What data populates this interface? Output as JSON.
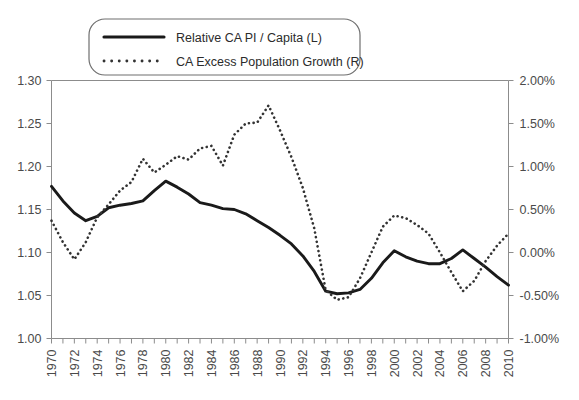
{
  "chart_data": {
    "type": "line",
    "title": "",
    "subtitle": "",
    "xlabel": "",
    "ylabel": "",
    "grid": false,
    "legend_position": "top-left",
    "x": [
      1970,
      1971,
      1972,
      1973,
      1974,
      1975,
      1976,
      1977,
      1978,
      1979,
      1980,
      1981,
      1982,
      1983,
      1984,
      1985,
      1986,
      1987,
      1988,
      1989,
      1990,
      1991,
      1992,
      1993,
      1994,
      1995,
      1996,
      1997,
      1998,
      1999,
      2000,
      2001,
      2002,
      2003,
      2004,
      2005,
      2006,
      2007,
      2008,
      2009,
      2010
    ],
    "xtick_labels": [
      "1970",
      "1972",
      "1974",
      "1976",
      "1978",
      "1980",
      "1982",
      "1984",
      "1986",
      "1988",
      "1990",
      "1992",
      "1994",
      "1996",
      "1998",
      "2000",
      "2002",
      "2004",
      "2006",
      "2008",
      "2010"
    ],
    "xlim": [
      1970,
      2010
    ],
    "left_axis": {
      "name": "Relative CA PI / Capita (L)",
      "ylim": [
        1.0,
        1.3
      ],
      "ytick_labels": [
        "1.00",
        "1.05",
        "1.10",
        "1.15",
        "1.20",
        "1.25",
        "1.30"
      ],
      "ytick_values": [
        1.0,
        1.05,
        1.1,
        1.15,
        1.2,
        1.25,
        1.3
      ]
    },
    "right_axis": {
      "name": "CA Excess Population Growth (R)",
      "ylim": [
        -1.0,
        2.0
      ],
      "ytick_labels": [
        "-1.00%",
        "-0.50%",
        "0.00%",
        "0.50%",
        "1.00%",
        "1.50%",
        "2.00%"
      ],
      "ytick_values": [
        -1.0,
        -0.5,
        0.0,
        0.5,
        1.0,
        1.5,
        2.0
      ]
    },
    "series": [
      {
        "name": "Relative CA PI / Capita (L)",
        "axis": "left",
        "style": "solid",
        "color": "#1a1a1a",
        "values": [
          1.177,
          1.16,
          1.146,
          1.137,
          1.142,
          1.152,
          1.155,
          1.157,
          1.16,
          1.172,
          1.183,
          1.176,
          1.168,
          1.158,
          1.155,
          1.151,
          1.15,
          1.145,
          1.137,
          1.129,
          1.12,
          1.11,
          1.096,
          1.078,
          1.055,
          1.052,
          1.053,
          1.057,
          1.07,
          1.088,
          1.102,
          1.095,
          1.09,
          1.087,
          1.087,
          1.093,
          1.103,
          1.093,
          1.083,
          1.072,
          1.062
        ]
      },
      {
        "name": "CA Excess Population Growth (R)",
        "axis": "right",
        "style": "dotted",
        "color": "#333333",
        "values": [
          0.37,
          0.12,
          -0.08,
          0.12,
          0.41,
          0.56,
          0.72,
          0.82,
          1.09,
          0.93,
          1.02,
          1.12,
          1.08,
          1.21,
          1.24,
          1.01,
          1.37,
          1.5,
          1.51,
          1.71,
          1.42,
          1.11,
          0.75,
          0.28,
          -0.44,
          -0.55,
          -0.52,
          -0.3,
          0.0,
          0.3,
          0.43,
          0.4,
          0.32,
          0.22,
          0.0,
          -0.23,
          -0.45,
          -0.33,
          -0.1,
          0.08,
          0.22
        ]
      }
    ]
  },
  "legend": {
    "items": [
      {
        "label": "Relative CA PI / Capita (L)",
        "marker": "solid-line-swatch"
      },
      {
        "label": "CA Excess Population Growth (R)",
        "marker": "dotted-line-swatch"
      }
    ]
  },
  "colors": {
    "axis": "#8c8c8c",
    "text": "#4a4a4a",
    "series_solid": "#1a1a1a",
    "series_dotted": "#333333",
    "background": "#ffffff",
    "legend_border": "#6f6f6f"
  }
}
